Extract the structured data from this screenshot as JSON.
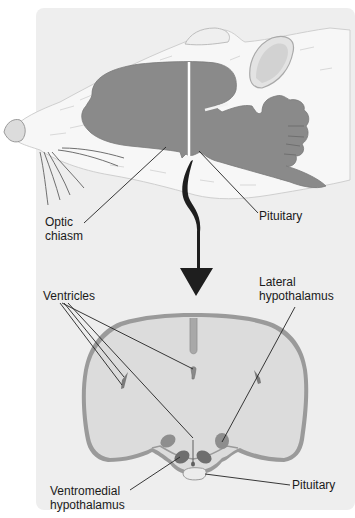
{
  "figure": {
    "top_panel": {
      "subject": "rat-head-sagittal-brain",
      "labels": {
        "optic_chiasm_line1": "Optic",
        "optic_chiasm_line2": "chiasm",
        "pituitary": "Pituitary"
      }
    },
    "arrow": {
      "direction": "down",
      "meaning": "coronal-section-at-cut-line"
    },
    "bottom_panel": {
      "subject": "coronal-brain-section",
      "labels": {
        "ventricles": "Ventricles",
        "lateral_hypothalamus_line1": "Lateral",
        "lateral_hypothalamus_line2": "hypothalamus",
        "ventromedial_hypothalamus_line1": "Ventromedial",
        "ventromedial_hypothalamus_line2": "hypothalamus",
        "pituitary": "Pituitary"
      }
    },
    "colors": {
      "panel_bg": "#eeeeee",
      "brain_fill": "#8a8a8a",
      "section_fill": "#dcdcdc",
      "section_outline": "#9a9a9a",
      "nuclei_dark": "#6e6e6e",
      "nuclei_mid": "#8e8e8e",
      "arrow": "#1e1e1e",
      "text": "#1a1a1a"
    }
  }
}
